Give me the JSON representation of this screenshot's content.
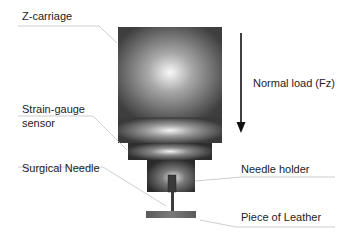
{
  "diagram": {
    "labels": {
      "z_carriage": "Z-carriage",
      "strain_gauge_line1": "Strain-gauge",
      "strain_gauge_line2": "sensor",
      "surgical_needle": "Surgical Needle",
      "normal_load": "Normal load (Fz)",
      "needle_holder": "Needle holder",
      "leather": "Piece of Leather"
    },
    "colors": {
      "body_dark": "#3a3a3a",
      "body_light": "#f4f4f4",
      "arrow": "#111111",
      "leader": "#b8b8b8",
      "text": "#222222"
    }
  }
}
